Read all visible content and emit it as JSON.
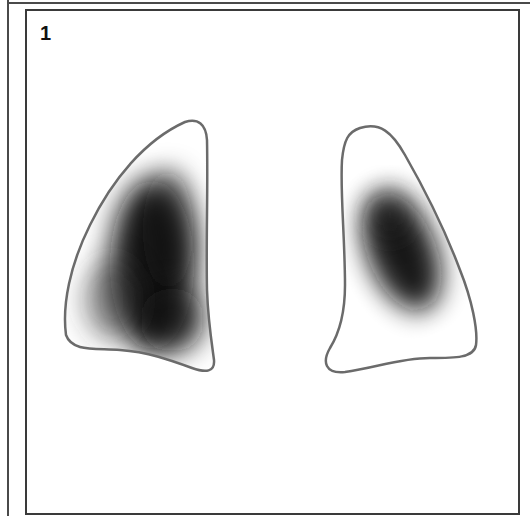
{
  "figure": {
    "panel_label": "1",
    "colors": {
      "outline": "#6b6b6b",
      "density": "#111111",
      "background": "#ffffff",
      "frame": "#3a3a3a"
    },
    "shapes": [
      {
        "name": "left-lung",
        "description": "Left-side lung outline with large dense dark region filling the lower and medial portion"
      },
      {
        "name": "right-lung",
        "description": "Right-side lung outline with oval dense dark region in mid-upper portion"
      }
    ]
  }
}
